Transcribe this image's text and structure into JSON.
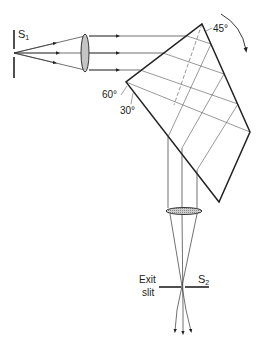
{
  "diagram": {
    "type": "optical-schematic",
    "labels": {
      "entrance_slit": "S",
      "entrance_slit_sub": "1",
      "exit_slit_name": "S",
      "exit_slit_sub": "2",
      "exit_slit_line1": "Exit",
      "exit_slit_line2": "slit",
      "angle_top": "45°",
      "angle_left_a": "60°",
      "angle_left_b": "30°"
    },
    "elements": [
      {
        "id": "entrance-slit",
        "label": "S1"
      },
      {
        "id": "collimating-lens"
      },
      {
        "id": "prism",
        "vertices": [
          [
            202,
            24
          ],
          [
            250,
            132
          ],
          [
            219,
            202
          ],
          [
            126,
            82
          ]
        ]
      },
      {
        "id": "rotation-arrow",
        "direction": "clockwise"
      },
      {
        "id": "focusing-lens"
      },
      {
        "id": "exit-slit",
        "label": "S2"
      }
    ],
    "colors": {
      "line": "#222222",
      "lens_fill": "#bdbdbd",
      "background": "#ffffff"
    }
  }
}
